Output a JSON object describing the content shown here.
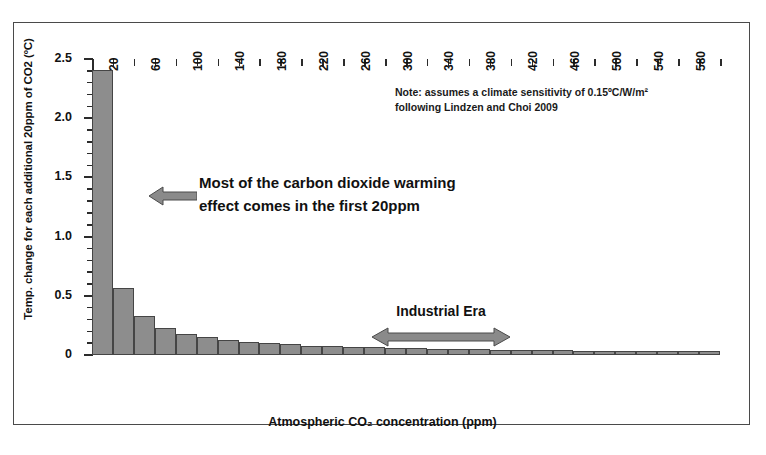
{
  "axes": {
    "ylabel": "Temp. change for each additional 20ppm of CO2 (ºC)",
    "xlabel": "Atmospheric CO₂ concentration (ppm)"
  },
  "annotations": {
    "note_line1": "Note: assumes a climate sensitivity of 0.15ºC/W/m²",
    "note_line2": "following Lindzen and Choi 2009",
    "callout_line1": "Most of the carbon dioxide warming",
    "callout_line2": "effect comes in the first 20ppm",
    "era_label": "Industrial Era"
  },
  "colors": {
    "bar_fill": "#8d8d8d",
    "bar_edge": "#454545",
    "arrow": "#8a8a8a",
    "arrow_edge": "#4a4a4a",
    "axis": "#2b2b2b",
    "frame": "#4a4a4a",
    "text": "#111111"
  },
  "chart_data": {
    "type": "bar",
    "title": "",
    "subtitle": "",
    "xlabel": "Atmospheric CO₂ concentration (ppm)",
    "ylabel": "Temp. change for each additional 20ppm of CO2 (ºC)",
    "ylim": [
      0,
      2.5
    ],
    "xlim": [
      0,
      600
    ],
    "grid": false,
    "legend": null,
    "y_ticks_major": [
      "0",
      "0.5",
      "1.0",
      "1.5",
      "2.0",
      "2.5"
    ],
    "y_ticks_major_values": [
      0,
      0.5,
      1.0,
      1.5,
      2.0,
      2.5
    ],
    "y_minor_tick_step": 0.1,
    "x_tick_labels": [
      "20",
      "60",
      "100",
      "140",
      "180",
      "220",
      "260",
      "300",
      "340",
      "380",
      "420",
      "460",
      "500",
      "540",
      "580"
    ],
    "x_tick_label_step": 40,
    "bar_width_ppm": 20,
    "categories": [
      20,
      40,
      60,
      80,
      100,
      120,
      140,
      160,
      180,
      200,
      220,
      240,
      260,
      280,
      300,
      320,
      340,
      360,
      380,
      400,
      420,
      440,
      460,
      480,
      500,
      520,
      540,
      560,
      580,
      600
    ],
    "values": [
      2.41,
      0.57,
      0.33,
      0.23,
      0.18,
      0.15,
      0.13,
      0.11,
      0.1,
      0.09,
      0.08,
      0.075,
      0.07,
      0.065,
      0.06,
      0.057,
      0.054,
      0.051,
      0.048,
      0.046,
      0.044,
      0.042,
      0.04,
      0.038,
      0.037,
      0.035,
      0.034,
      0.033,
      0.032,
      0.031
    ],
    "annotations": [
      {
        "text": "Most of the carbon dioxide warming effect comes in the first 20ppm",
        "kind": "callout-arrow-left",
        "points_to_ppm": 20
      },
      {
        "text": "Note: assumes a climate sensitivity of 0.15ºC/W/m² following Lindzen and Choi 2009",
        "kind": "note"
      },
      {
        "text": "Industrial Era",
        "kind": "span-arrow",
        "from_ppm": 280,
        "to_ppm": 400
      }
    ]
  }
}
